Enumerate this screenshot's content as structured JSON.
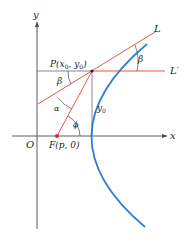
{
  "figure": {
    "colors": {
      "axis": "#4a4a4a",
      "parabola": "#2f7fd0",
      "lines": "#e8403a",
      "guide": "#6a6a6a",
      "focus": "#d62a2a"
    },
    "labels": {
      "y_axis": "y",
      "x_axis": "x",
      "origin": "O",
      "point_P_prefix": "P(x",
      "point_P_sub0": "0",
      "point_P_mid": ", y",
      "point_P_sub1": "0",
      "point_P_suffix": ")",
      "focus": "F(p, 0)",
      "tangent_line": "L",
      "horizontal_line": "L′",
      "beta_right": "β",
      "beta_left": "β",
      "alpha": "α",
      "phi": "ϕ",
      "y0_main": "y",
      "y0_sub": "0"
    }
  }
}
